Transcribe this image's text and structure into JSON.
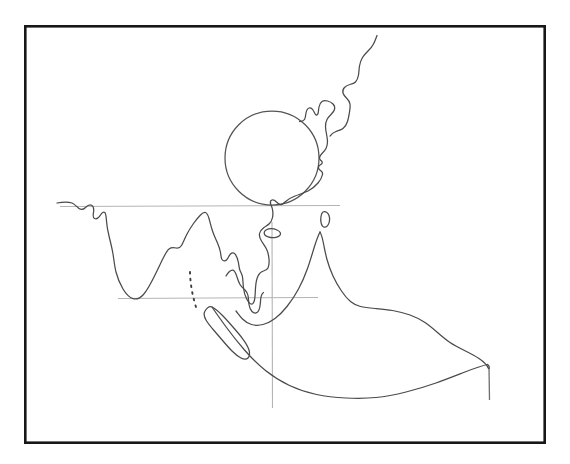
{
  "figure": {
    "kind": "hand-drawn-sketch-map",
    "title": "",
    "region_depicted": "South and Southeast Asia coastline outline",
    "background_color": "#ffffff",
    "canvas": {
      "width": 570,
      "height": 464
    }
  },
  "frame": {
    "name": "border-frame",
    "x": 24,
    "y": 25,
    "width": 522,
    "height": 419,
    "stroke_color": "#171717",
    "stroke_width": 2.6,
    "fill_color": "#ffffff"
  },
  "style": {
    "coastline_color": "#4a4a4a",
    "coastline_width": 1.25,
    "gridline_color": "#b4b4b4",
    "gridline_width": 1.1,
    "circle_color": "#545454",
    "dotted_chain_color": "#3c3c3c",
    "tick_color": "#6e6e6e"
  },
  "reference_lines": [
    {
      "name": "upper-horizontal-line",
      "orientation": "horizontal",
      "y": 206,
      "x_start": 60,
      "x_end": 340,
      "style": "solid-light"
    },
    {
      "name": "lower-horizontal-line",
      "orientation": "horizontal",
      "y": 298,
      "x_start": 118,
      "x_end": 318,
      "style": "solid-light"
    },
    {
      "name": "vertical-line",
      "orientation": "vertical",
      "x": 272,
      "y_start": 222,
      "y_end": 408,
      "style": "solid-light"
    },
    {
      "name": "right-edge-tick",
      "orientation": "vertical",
      "x": 489,
      "y_start": 368,
      "y_end": 400,
      "style": "solid-dark"
    }
  ],
  "overlays": [
    {
      "name": "circle-overlay",
      "shape": "circle",
      "center_x": 272,
      "center_y": 158,
      "radius": 47,
      "stroke_color": "#545454"
    },
    {
      "name": "dotted-island-chain",
      "shape": "dotted-line",
      "x_start": 190,
      "y_start": 272,
      "x_end": 197,
      "y_end": 310
    }
  ],
  "islands": [
    {
      "name": "island-small-upper-right",
      "center_x": 325,
      "center_y": 220
    },
    {
      "name": "island-small-below-circle",
      "center_x": 273,
      "center_y": 233
    }
  ],
  "landmass_parts": [
    {
      "name": "main-coastline",
      "description": "western peninsula through eastern coastline"
    },
    {
      "name": "northeast-coast-strip",
      "description": "upper right coastal strip"
    },
    {
      "name": "southern-island-arc",
      "description": "lower elongated island"
    },
    {
      "name": "eastern-landmass",
      "description": "right-hand peaked landmass with long tail"
    }
  ]
}
